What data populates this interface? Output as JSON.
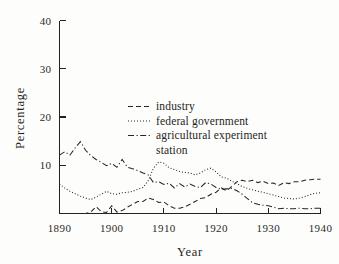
{
  "figure": {
    "background_color": "#fdfdfc",
    "ink_color": "#262624"
  },
  "chart_data": {
    "type": "line",
    "title": "",
    "xlabel": "Year",
    "ylabel": "Percentage",
    "xlim": [
      1890,
      1940
    ],
    "ylim": [
      0,
      40
    ],
    "xticks": [
      1890,
      1900,
      1910,
      1920,
      1930,
      1940
    ],
    "xticklabels": [
      "1890",
      "1900",
      "1910",
      "1920",
      "1930",
      "1940"
    ],
    "yticks": [
      10,
      20,
      30,
      40
    ],
    "yticklabels": [
      "10",
      "20",
      "30",
      "40"
    ],
    "grid": false,
    "legend_position": "center-upper",
    "x": [
      1890,
      1891,
      1892,
      1893,
      1894,
      1895,
      1896,
      1897,
      1898,
      1899,
      1900,
      1901,
      1902,
      1903,
      1904,
      1905,
      1906,
      1907,
      1908,
      1909,
      1910,
      1911,
      1912,
      1913,
      1914,
      1915,
      1916,
      1917,
      1918,
      1919,
      1920,
      1921,
      1922,
      1923,
      1924,
      1925,
      1926,
      1927,
      1928,
      1929,
      1930,
      1931,
      1932,
      1933,
      1934,
      1935,
      1936,
      1937,
      1938,
      1939,
      1940
    ],
    "series": [
      {
        "name": "industry",
        "style": "dashed",
        "dasharray": "5,3",
        "values": [
          0.0,
          0.0,
          0.0,
          0.0,
          0.0,
          0.0,
          0.3,
          1.4,
          0.4,
          0.2,
          1.6,
          0.3,
          0.6,
          1.3,
          1.9,
          2.5,
          2.5,
          3.2,
          2.9,
          2.3,
          2.4,
          1.6,
          1.1,
          1.1,
          1.4,
          1.9,
          2.5,
          3.1,
          3.3,
          4.0,
          4.4,
          5.3,
          4.7,
          5.6,
          6.6,
          6.9,
          6.6,
          6.9,
          6.4,
          6.7,
          6.2,
          6.3,
          5.8,
          6.4,
          6.2,
          6.6,
          6.6,
          6.9,
          7.0,
          7.1,
          7.1
        ]
      },
      {
        "name": "federal government",
        "style": "dotted",
        "dasharray": "1,2",
        "values": [
          6.1,
          5.3,
          4.6,
          4.1,
          3.6,
          3.2,
          2.9,
          3.4,
          4.0,
          4.6,
          4.1,
          4.0,
          4.3,
          4.4,
          4.6,
          5.0,
          5.4,
          6.8,
          9.4,
          10.7,
          10.4,
          9.5,
          9.1,
          8.7,
          8.5,
          8.4,
          8.0,
          8.4,
          9.1,
          9.4,
          8.6,
          7.6,
          7.3,
          6.7,
          6.2,
          5.6,
          5.2,
          4.9,
          4.6,
          4.4,
          4.1,
          3.8,
          3.5,
          3.2,
          3.1,
          3.0,
          3.2,
          3.5,
          3.9,
          4.2,
          4.3
        ]
      },
      {
        "name": "agricultural experiment station",
        "style": "dash-dot",
        "dasharray": "6,2.5,1.2,2.5",
        "values": [
          12.1,
          12.8,
          12.1,
          13.6,
          14.9,
          13.1,
          12.0,
          11.2,
          10.6,
          9.9,
          10.4,
          9.6,
          11.2,
          9.6,
          9.3,
          8.9,
          8.4,
          8.0,
          6.4,
          6.6,
          6.0,
          6.3,
          5.3,
          6.2,
          5.5,
          6.1,
          5.6,
          5.4,
          6.4,
          6.1,
          5.4,
          5.0,
          5.1,
          5.2,
          4.7,
          4.0,
          3.1,
          2.2,
          1.9,
          1.7,
          1.6,
          1.3,
          1.0,
          1.1,
          1.0,
          1.0,
          1.1,
          1.0,
          1.0,
          1.1,
          1.1
        ]
      }
    ]
  },
  "legend": {
    "entries": [
      {
        "label": "industry"
      },
      {
        "label": "federal government"
      },
      {
        "label": "agricultural experiment"
      },
      {
        "label": "station"
      }
    ]
  }
}
